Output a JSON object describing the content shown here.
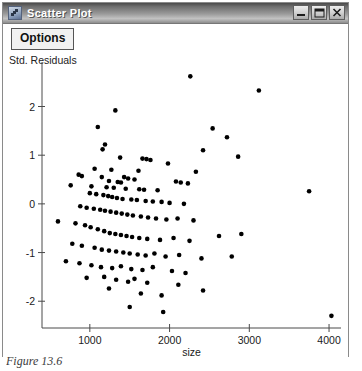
{
  "window": {
    "title": "Scatter Plot",
    "icon": "app-icon",
    "controls": [
      {
        "name": "minimize",
        "glyph": "minimize-icon"
      },
      {
        "name": "maximize",
        "glyph": "maximize-icon"
      },
      {
        "name": "close",
        "glyph": "close-icon"
      }
    ]
  },
  "toolbar": {
    "options_label": "Options"
  },
  "caption": {
    "text": "Figure 13.6"
  },
  "colors": {
    "point": "#000000",
    "axis": "#4a4a4a",
    "title_text": "#ffffff",
    "background": "#ffffff"
  },
  "chart_data": {
    "type": "scatter",
    "title": "",
    "xlabel": "size",
    "ylabel": "Std. Residuals",
    "xlim": [
      400,
      4150
    ],
    "ylim": [
      -2.55,
      2.75
    ],
    "xticks": [
      1000,
      2000,
      3000,
      4000
    ],
    "yticks": [
      2,
      1,
      0,
      -1,
      -2
    ],
    "grid": false,
    "legend": null,
    "points": [
      [
        2260,
        2.62
      ],
      [
        3120,
        2.33
      ],
      [
        1320,
        1.92
      ],
      [
        1100,
        1.58
      ],
      [
        2540,
        1.55
      ],
      [
        2720,
        1.37
      ],
      [
        1190,
        1.22
      ],
      [
        1160,
        1.12
      ],
      [
        2420,
        1.1
      ],
      [
        2860,
        0.97
      ],
      [
        1380,
        0.95
      ],
      [
        1660,
        0.93
      ],
      [
        1710,
        0.92
      ],
      [
        1760,
        0.9
      ],
      [
        1980,
        0.83
      ],
      [
        1060,
        0.72
      ],
      [
        1270,
        0.7
      ],
      [
        1610,
        0.68
      ],
      [
        2330,
        0.66
      ],
      [
        860,
        0.6
      ],
      [
        900,
        0.57
      ],
      [
        1150,
        0.55
      ],
      [
        1430,
        0.55
      ],
      [
        1480,
        0.52
      ],
      [
        1560,
        0.5
      ],
      [
        1240,
        0.47
      ],
      [
        1350,
        0.45
      ],
      [
        1390,
        0.44
      ],
      [
        2080,
        0.46
      ],
      [
        2140,
        0.44
      ],
      [
        2230,
        0.42
      ],
      [
        760,
        0.38
      ],
      [
        1020,
        0.36
      ],
      [
        1210,
        0.34
      ],
      [
        1300,
        0.33
      ],
      [
        1450,
        0.31
      ],
      [
        1620,
        0.3
      ],
      [
        1680,
        0.29
      ],
      [
        1850,
        0.28
      ],
      [
        3750,
        0.26
      ],
      [
        1000,
        0.22
      ],
      [
        1080,
        0.2
      ],
      [
        1170,
        0.18
      ],
      [
        1230,
        0.16
      ],
      [
        1280,
        0.14
      ],
      [
        1340,
        0.12
      ],
      [
        1410,
        0.1
      ],
      [
        1520,
        0.09
      ],
      [
        1590,
        0.08
      ],
      [
        1700,
        0.06
      ],
      [
        1790,
        0.05
      ],
      [
        1900,
        0.04
      ],
      [
        2000,
        0.02
      ],
      [
        2180,
        0.0
      ],
      [
        880,
        -0.05
      ],
      [
        960,
        -0.08
      ],
      [
        1050,
        -0.1
      ],
      [
        1130,
        -0.12
      ],
      [
        1190,
        -0.14
      ],
      [
        1260,
        -0.16
      ],
      [
        1330,
        -0.18
      ],
      [
        1400,
        -0.2
      ],
      [
        1470,
        -0.22
      ],
      [
        1540,
        -0.24
      ],
      [
        1640,
        -0.26
      ],
      [
        1730,
        -0.28
      ],
      [
        1830,
        -0.3
      ],
      [
        1960,
        -0.32
      ],
      [
        2100,
        -0.3
      ],
      [
        2300,
        -0.34
      ],
      [
        600,
        -0.36
      ],
      [
        820,
        -0.4
      ],
      [
        940,
        -0.44
      ],
      [
        1010,
        -0.48
      ],
      [
        1100,
        -0.52
      ],
      [
        1180,
        -0.56
      ],
      [
        1250,
        -0.6
      ],
      [
        1320,
        -0.62
      ],
      [
        1390,
        -0.64
      ],
      [
        1460,
        -0.66
      ],
      [
        1530,
        -0.68
      ],
      [
        1620,
        -0.7
      ],
      [
        1720,
        -0.72
      ],
      [
        1880,
        -0.74
      ],
      [
        2050,
        -0.7
      ],
      [
        2250,
        -0.76
      ],
      [
        2620,
        -0.66
      ],
      [
        2900,
        -0.62
      ],
      [
        780,
        -0.82
      ],
      [
        900,
        -0.86
      ],
      [
        1060,
        -0.9
      ],
      [
        1150,
        -0.94
      ],
      [
        1240,
        -0.96
      ],
      [
        1330,
        -0.98
      ],
      [
        1420,
        -1.0
      ],
      [
        1500,
        -1.02
      ],
      [
        1600,
        -1.04
      ],
      [
        1700,
        -1.06
      ],
      [
        1810,
        -1.02
      ],
      [
        1950,
        -1.08
      ],
      [
        2120,
        -1.05
      ],
      [
        2400,
        -1.12
      ],
      [
        2780,
        -1.08
      ],
      [
        700,
        -1.18
      ],
      [
        870,
        -1.22
      ],
      [
        1020,
        -1.26
      ],
      [
        1140,
        -1.3
      ],
      [
        1280,
        -1.32
      ],
      [
        1390,
        -1.28
      ],
      [
        1520,
        -1.34
      ],
      [
        1660,
        -1.36
      ],
      [
        1790,
        -1.3
      ],
      [
        2030,
        -1.38
      ],
      [
        2200,
        -1.42
      ],
      [
        960,
        -1.52
      ],
      [
        1180,
        -1.5
      ],
      [
        1330,
        -1.56
      ],
      [
        1480,
        -1.6
      ],
      [
        1560,
        -1.54
      ],
      [
        1720,
        -1.62
      ],
      [
        2110,
        -1.66
      ],
      [
        1240,
        -1.74
      ],
      [
        1640,
        -1.84
      ],
      [
        1900,
        -1.88
      ],
      [
        2420,
        -1.78
      ],
      [
        1500,
        -2.12
      ],
      [
        1920,
        -2.22
      ],
      [
        4030,
        -2.3
      ]
    ]
  }
}
